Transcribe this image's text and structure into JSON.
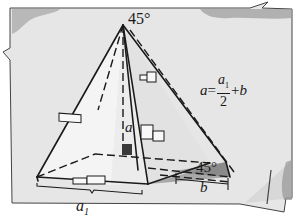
{
  "figure": {
    "type": "pyramid-geometry-illustration",
    "labels": {
      "apex_angle": "45°",
      "base_angle": "45°",
      "height_label": "a",
      "offset_label": "b",
      "base_width_label": "a",
      "base_width_subscript": "1"
    },
    "formula": {
      "lhs": "a",
      "equals": "=",
      "numerator": "a",
      "numerator_subscript": "1",
      "denominator": "2",
      "plus": "+",
      "tail": "b"
    },
    "colors": {
      "paper": "#e6e6e6",
      "paper_shade": "#d2d2d2",
      "frame_stroke": "#444444",
      "pyramid_face_light": "#f2f2f2",
      "pyramid_face_shade": "#dcdcdc",
      "ink": "#1a1a1a",
      "right_angle_marker": "#3a3a3a",
      "shadow_triangle": "#8a8a8a"
    }
  }
}
